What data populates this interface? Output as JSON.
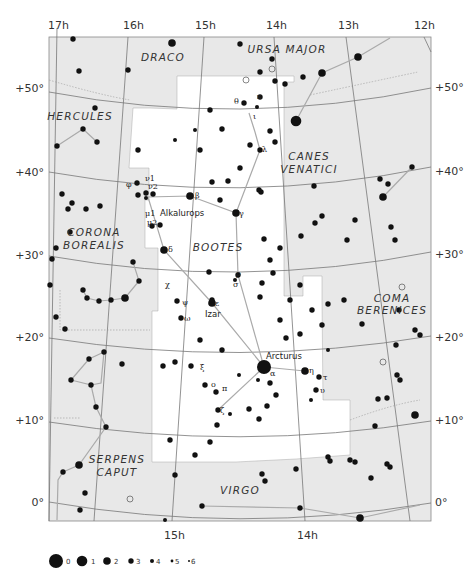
{
  "colors": {
    "background": "#ffffff",
    "outside_region": "#e8e8e8",
    "focus_region": "#ffffff",
    "grid_line": "#777777",
    "boundary_line": "#999999",
    "asterism_line": "#aaaaaa",
    "star": "#111111",
    "text": "#333333"
  },
  "ra_labels_top": [
    "17h",
    "16h",
    "15h",
    "14h",
    "13h",
    "12h"
  ],
  "ra_labels_bottom": [
    "15h",
    "14h"
  ],
  "dec_labels_left": [
    "+50°",
    "+40°",
    "+30°",
    "+20°",
    "+10°",
    "0°"
  ],
  "dec_labels_right": [
    "+50°",
    "+40°",
    "+30°",
    "+20°",
    "+10°",
    "0°"
  ],
  "constellations": [
    {
      "name": "DRACO",
      "lines": [
        "DRACO"
      ]
    },
    {
      "name": "URSA MAJOR",
      "lines": [
        "URSA MAJOR"
      ]
    },
    {
      "name": "HERCULES",
      "lines": [
        "HERCULES"
      ]
    },
    {
      "name": "CANES VENATICI",
      "lines": [
        "CANES",
        "VENATICI"
      ]
    },
    {
      "name": "CORONA BOREALIS",
      "lines": [
        "CORONA",
        "BOREALIS"
      ]
    },
    {
      "name": "BOOTES",
      "lines": [
        "BOOTES"
      ]
    },
    {
      "name": "COMA BERENICES",
      "lines": [
        "COMA",
        "BERENICES"
      ]
    },
    {
      "name": "SERPENS CAPUT",
      "lines": [
        "SERPENS",
        "CAPUT"
      ]
    },
    {
      "name": "VIRGO",
      "lines": [
        "VIRGO"
      ]
    }
  ],
  "named_stars": [
    {
      "name": "Arcturus",
      "greek": "α"
    },
    {
      "name": "Izar",
      "greek": "ε"
    },
    {
      "name": "Alkalurops",
      "greek": "μ"
    }
  ],
  "greek_labels": [
    "θ",
    "κ",
    "ι",
    "λ",
    "β",
    "γ",
    "δ",
    "ρ",
    "σ",
    "χ",
    "ψ",
    "ω",
    "ξ",
    "ο",
    "π",
    "ζ",
    "η",
    "τ",
    "υ",
    "φ",
    "ν1",
    "ν2",
    "μ1",
    "μ2",
    "ε",
    "α"
  ],
  "legend": {
    "title": "Magnitude",
    "magnitudes": [
      "0",
      "1",
      "2",
      "3",
      "4",
      "5",
      "6"
    ]
  }
}
